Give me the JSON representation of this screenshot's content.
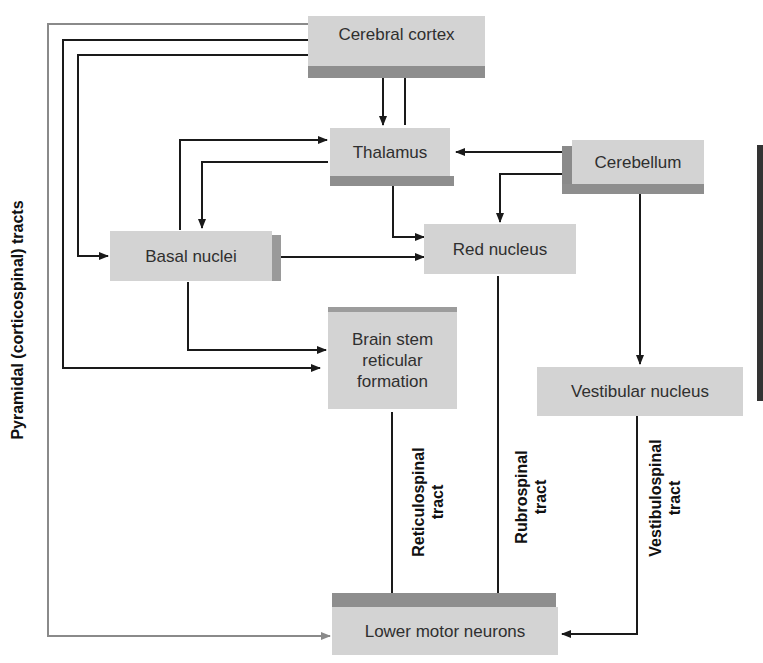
{
  "diagram": {
    "nodes": {
      "cerebral_cortex": "Cerebral cortex",
      "thalamus": "Thalamus",
      "cerebellum": "Cerebellum",
      "basal_nuclei": "Basal nuclei",
      "red_nucleus": "Red nucleus",
      "brain_stem": "Brain stem reticular formation",
      "brain_stem_lines": [
        "Brain stem",
        "reticular",
        "formation"
      ],
      "vestibular_nucleus": "Vestibular nucleus",
      "lower_motor_neurons": "Lower motor neurons"
    },
    "tract_labels": {
      "pyramidal": "Pyramidal (corticospinal) tracts",
      "reticulospinal": [
        "Reticulospinal",
        "tract"
      ],
      "rubrospinal": [
        "Rubrospinal",
        "tract"
      ],
      "vestibulospinal": [
        "Vestibulospinal",
        "tract"
      ]
    },
    "edges": [
      {
        "from": "Cerebral cortex",
        "to": "Thalamus"
      },
      {
        "from": "Thalamus",
        "to": "Cerebral cortex"
      },
      {
        "from": "Cerebral cortex",
        "to": "Basal nuclei"
      },
      {
        "from": "Cerebral cortex",
        "to": "Brain stem reticular formation"
      },
      {
        "from": "Cerebral cortex",
        "to": "Lower motor neurons",
        "label": "Pyramidal (corticospinal) tracts"
      },
      {
        "from": "Basal nuclei",
        "to": "Thalamus"
      },
      {
        "from": "Thalamus",
        "to": "Basal nuclei"
      },
      {
        "from": "Cerebellum",
        "to": "Thalamus"
      },
      {
        "from": "Cerebellum",
        "to": "Red nucleus"
      },
      {
        "from": "Thalamus",
        "to": "Red nucleus"
      },
      {
        "from": "Basal nuclei",
        "to": "Red nucleus"
      },
      {
        "from": "Basal nuclei",
        "to": "Brain stem reticular formation"
      },
      {
        "from": "Cerebellum",
        "to": "Vestibular nucleus"
      },
      {
        "from": "Brain stem reticular formation",
        "to": "Lower motor neurons",
        "label": "Reticulospinal tract"
      },
      {
        "from": "Red nucleus",
        "to": "Lower motor neurons",
        "label": "Rubrospinal tract"
      },
      {
        "from": "Vestibular nucleus",
        "to": "Lower motor neurons",
        "label": "Vestibulospinal tract"
      }
    ],
    "colors": {
      "box_fill": "#d3d3d3",
      "box_shadow": "#8e8e8e",
      "line": "#1a1a1a",
      "pyramidal_line": "#8a8a8a"
    }
  }
}
